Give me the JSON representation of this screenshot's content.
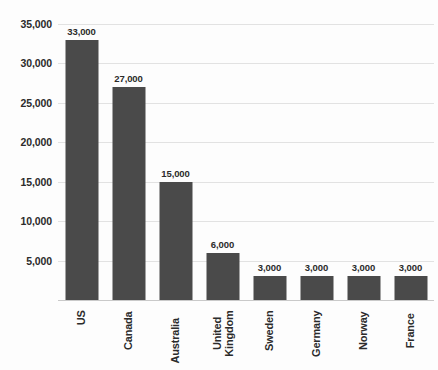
{
  "chart_data": {
    "type": "bar",
    "title": "",
    "subtitle": "",
    "xlabel": "",
    "ylabel": "",
    "categories": [
      "US",
      "Canada",
      "Australia",
      "United Kingdom",
      "Sweden",
      "Germany",
      "Norway",
      "France"
    ],
    "values": [
      33000,
      27000,
      15000,
      6000,
      3000,
      3000,
      3000,
      3000
    ],
    "value_labels": [
      "33,000",
      "27,000",
      "15,000",
      "6,000",
      "3,000",
      "3,000",
      "3,000",
      "3,000"
    ],
    "ylim": [
      0,
      35000
    ],
    "y_ticks": [
      5000,
      10000,
      15000,
      20000,
      25000,
      30000,
      35000
    ],
    "y_tick_labels": [
      "5,000",
      "10,000",
      "15,000",
      "20,000",
      "25,000",
      "30,000",
      "35,000"
    ],
    "grid": true,
    "legend": "none",
    "bar_color": "#4a4a4a",
    "gridline_color": "#e2e2e2",
    "axis_color": "#c9c9c9",
    "background_color": "#fdfdfd",
    "text_color": "#2b2b2b"
  }
}
